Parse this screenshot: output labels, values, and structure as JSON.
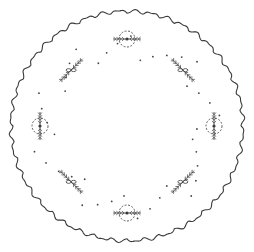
{
  "illustration": {
    "subject": "Circular scalloped doily embroidery pattern",
    "background": "#ffffff",
    "line_color": "#3a3a3a",
    "dot_color": "#444444",
    "center": [
      127,
      126
    ],
    "outer_radius": 117,
    "scallop_count": 44,
    "motifs": [
      {
        "type": "wreath",
        "angle": -90
      },
      {
        "type": "spray-with-bow",
        "angle": -45
      },
      {
        "type": "wreath",
        "angle": 0
      },
      {
        "type": "spray-with-bow",
        "angle": 45
      },
      {
        "type": "wreath",
        "angle": 90
      },
      {
        "type": "spray-with-bow",
        "angle": 135
      },
      {
        "type": "wreath",
        "angle": 180
      },
      {
        "type": "spray-with-bow",
        "angle": 225
      }
    ]
  }
}
